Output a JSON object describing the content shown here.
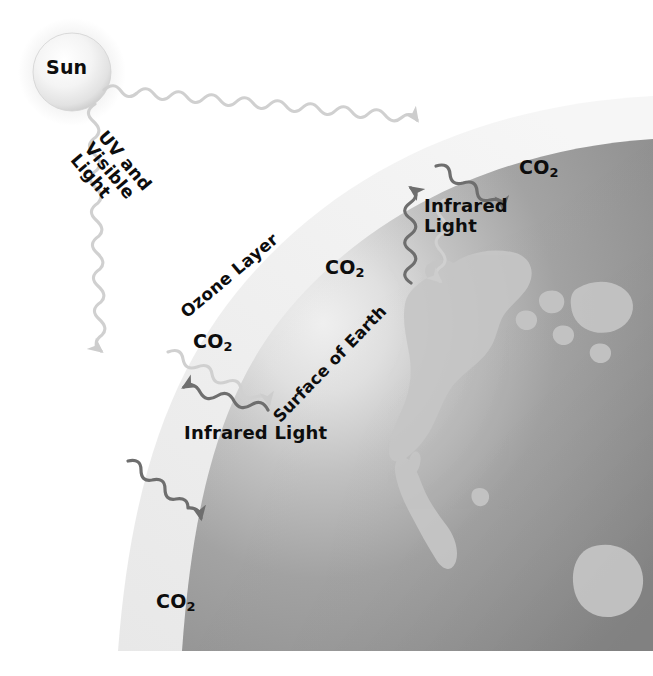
{
  "diagram": {
    "background_color": "#ffffff"
  },
  "sun": {
    "label": "Sun",
    "fill_color": "#f2f2f2",
    "edge_color": "#c9c9c9",
    "center_x": 72,
    "center_y": 72,
    "radius": 39
  },
  "atmosphere": {
    "name": "Ozone Layer",
    "label": "Ozone Layer",
    "fill_color": "#eeeeee"
  },
  "earth": {
    "label": "Surface of Earth",
    "ocean_color": "#9a9a9a",
    "land_color": "#c4c4c4",
    "highlight_color": "#f0f0f0"
  },
  "gas_labels": [
    {
      "id": "co2-upper-mid",
      "text": "CO",
      "sub": "2"
    },
    {
      "id": "co2-upper-right",
      "text": "CO",
      "sub": "2"
    },
    {
      "id": "co2-left-mid",
      "text": "CO",
      "sub": "2"
    },
    {
      "id": "co2-bottom",
      "text": "CO",
      "sub": "2"
    }
  ],
  "rays": {
    "incoming": {
      "label": "UV and Visible Light",
      "label_lines": [
        "UV and",
        "Visible",
        "Light"
      ],
      "color": "#d0d0d0"
    },
    "outgoing": {
      "label": "Infrared Light",
      "label_lines_upper": [
        "Infrared",
        "Light"
      ],
      "label_lower": "Infrared Light",
      "color": "#707070"
    }
  },
  "colors": {
    "text": "#0d0d0d",
    "uv_ray": "#d0d0d0",
    "ir_ray": "#6e6e6e",
    "atmosphere": "#eeeeee",
    "ocean": "#9a9a9a",
    "land": "#c4c4c4",
    "page": "#ffffff"
  }
}
